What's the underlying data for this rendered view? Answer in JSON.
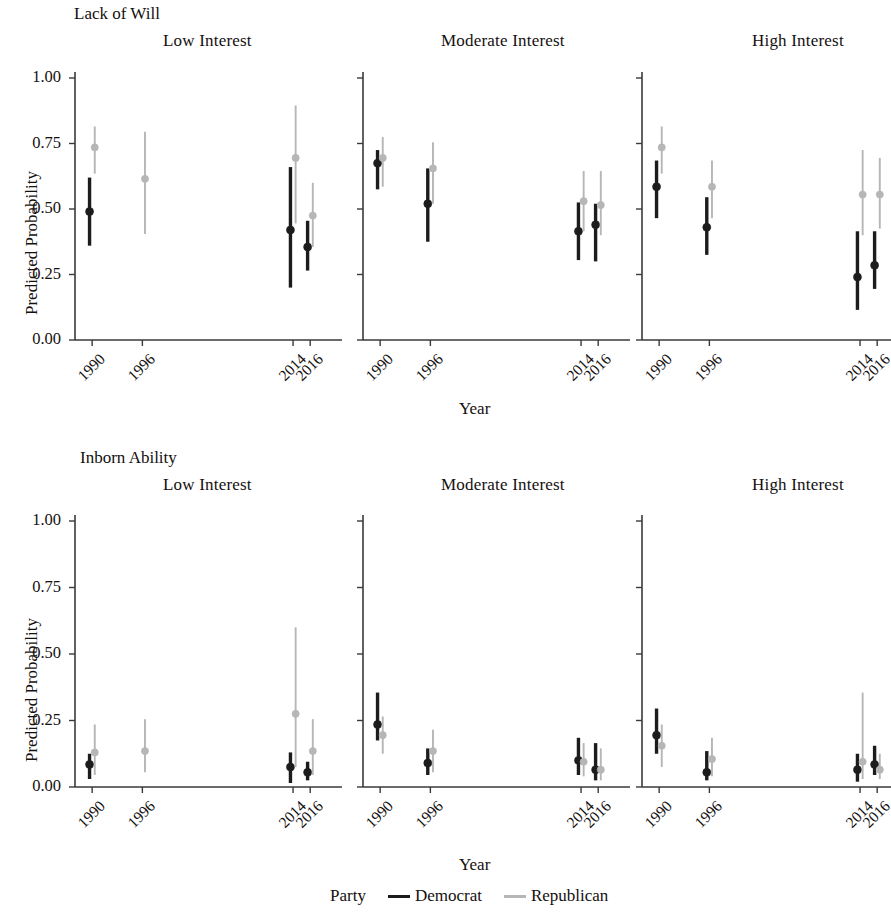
{
  "figure": {
    "y_axis_title": "Predicted Probability",
    "x_axis_title": "Year",
    "row_titles": [
      "Lack of Will",
      "Inborn Ability"
    ],
    "column_titles": [
      "Low Interest",
      "Moderate Interest",
      "High Interest"
    ],
    "y_ticks": [
      "0.00",
      "0.25",
      "0.50",
      "0.75",
      "1.00"
    ],
    "x_ticks": [
      "1990",
      "1996",
      "2014",
      "2016"
    ],
    "legend": {
      "title": "Party",
      "entries": [
        {
          "label": "Democrat",
          "color": "#1c1c1c"
        },
        {
          "label": "Republican",
          "color": "#b6b6b6"
        }
      ]
    }
  },
  "chart_data": {
    "type": "scatter",
    "xlabel": "Year",
    "ylabel": "Predicted Probability",
    "ylim": [
      0.0,
      1.0
    ],
    "yticks": [
      0.0,
      0.25,
      0.5,
      0.75,
      1.0
    ],
    "x": [
      1990,
      1996,
      2014,
      2016
    ],
    "grid": false,
    "legend_position": "bottom",
    "error_bars": "95% confidence intervals",
    "panels": [
      {
        "row": "Lack of Will",
        "column": "Low Interest",
        "series": [
          {
            "name": "Democrat",
            "color": "#1c1c1c",
            "points": [
              {
                "x": 1990,
                "y": 0.49,
                "lo": 0.36,
                "hi": 0.62
              },
              {
                "x": 1996,
                "y": null,
                "lo": null,
                "hi": null
              },
              {
                "x": 2014,
                "y": 0.42,
                "lo": 0.2,
                "hi": 0.66
              },
              {
                "x": 2016,
                "y": 0.355,
                "lo": 0.265,
                "hi": 0.455
              }
            ]
          },
          {
            "name": "Republican",
            "color": "#b6b6b6",
            "points": [
              {
                "x": 1990,
                "y": 0.735,
                "lo": 0.635,
                "hi": 0.815
              },
              {
                "x": 1996,
                "y": 0.615,
                "lo": 0.405,
                "hi": 0.795
              },
              {
                "x": 2014,
                "y": 0.695,
                "lo": 0.445,
                "hi": 0.895
              },
              {
                "x": 2016,
                "y": 0.475,
                "lo": 0.355,
                "hi": 0.6
              }
            ]
          }
        ]
      },
      {
        "row": "Lack of Will",
        "column": "Moderate Interest",
        "series": [
          {
            "name": "Democrat",
            "color": "#1c1c1c",
            "points": [
              {
                "x": 1990,
                "y": 0.675,
                "lo": 0.575,
                "hi": 0.725
              },
              {
                "x": 1996,
                "y": 0.52,
                "lo": 0.375,
                "hi": 0.655
              },
              {
                "x": 2014,
                "y": 0.415,
                "lo": 0.305,
                "hi": 0.525
              },
              {
                "x": 2016,
                "y": 0.44,
                "lo": 0.3,
                "hi": 0.52
              }
            ]
          },
          {
            "name": "Republican",
            "color": "#b6b6b6",
            "points": [
              {
                "x": 1990,
                "y": 0.695,
                "lo": 0.585,
                "hi": 0.775
              },
              {
                "x": 1996,
                "y": 0.655,
                "lo": 0.52,
                "hi": 0.755
              },
              {
                "x": 2014,
                "y": 0.53,
                "lo": 0.415,
                "hi": 0.645
              },
              {
                "x": 2016,
                "y": 0.515,
                "lo": 0.4,
                "hi": 0.645
              }
            ]
          }
        ]
      },
      {
        "row": "Lack of Will",
        "column": "High Interest",
        "series": [
          {
            "name": "Democrat",
            "color": "#1c1c1c",
            "points": [
              {
                "x": 1990,
                "y": 0.585,
                "lo": 0.465,
                "hi": 0.685
              },
              {
                "x": 1996,
                "y": 0.43,
                "lo": 0.325,
                "hi": 0.545
              },
              {
                "x": 2014,
                "y": 0.24,
                "lo": 0.115,
                "hi": 0.415
              },
              {
                "x": 2016,
                "y": 0.285,
                "lo": 0.195,
                "hi": 0.415
              }
            ]
          },
          {
            "name": "Republican",
            "color": "#b6b6b6",
            "points": [
              {
                "x": 1990,
                "y": 0.735,
                "lo": 0.635,
                "hi": 0.815
              },
              {
                "x": 1996,
                "y": 0.585,
                "lo": 0.465,
                "hi": 0.685
              },
              {
                "x": 2014,
                "y": 0.555,
                "lo": 0.4,
                "hi": 0.725
              },
              {
                "x": 2016,
                "y": 0.555,
                "lo": 0.425,
                "hi": 0.695
              }
            ]
          }
        ]
      },
      {
        "row": "Inborn Ability",
        "column": "Low Interest",
        "series": [
          {
            "name": "Democrat",
            "color": "#1c1c1c",
            "points": [
              {
                "x": 1990,
                "y": 0.085,
                "lo": 0.03,
                "hi": 0.125
              },
              {
                "x": 1996,
                "y": null,
                "lo": null,
                "hi": null
              },
              {
                "x": 2014,
                "y": 0.075,
                "lo": 0.015,
                "hi": 0.13
              },
              {
                "x": 2016,
                "y": 0.055,
                "lo": 0.025,
                "hi": 0.095
              }
            ]
          },
          {
            "name": "Republican",
            "color": "#b6b6b6",
            "points": [
              {
                "x": 1990,
                "y": 0.13,
                "lo": 0.045,
                "hi": 0.235
              },
              {
                "x": 1996,
                "y": 0.135,
                "lo": 0.055,
                "hi": 0.255
              },
              {
                "x": 2014,
                "y": 0.275,
                "lo": 0.075,
                "hi": 0.6
              },
              {
                "x": 2016,
                "y": 0.135,
                "lo": 0.045,
                "hi": 0.255
              }
            ]
          }
        ]
      },
      {
        "row": "Inborn Ability",
        "column": "Moderate Interest",
        "series": [
          {
            "name": "Democrat",
            "color": "#1c1c1c",
            "points": [
              {
                "x": 1990,
                "y": 0.235,
                "lo": 0.175,
                "hi": 0.355
              },
              {
                "x": 1996,
                "y": 0.09,
                "lo": 0.045,
                "hi": 0.145
              },
              {
                "x": 2014,
                "y": 0.1,
                "lo": 0.045,
                "hi": 0.185
              },
              {
                "x": 2016,
                "y": 0.065,
                "lo": 0.025,
                "hi": 0.165
              }
            ]
          },
          {
            "name": "Republican",
            "color": "#b6b6b6",
            "points": [
              {
                "x": 1990,
                "y": 0.195,
                "lo": 0.125,
                "hi": 0.265
              },
              {
                "x": 1996,
                "y": 0.135,
                "lo": 0.055,
                "hi": 0.215
              },
              {
                "x": 2014,
                "y": 0.095,
                "lo": 0.04,
                "hi": 0.165
              },
              {
                "x": 2016,
                "y": 0.065,
                "lo": 0.025,
                "hi": 0.145
              }
            ]
          }
        ]
      },
      {
        "row": "Inborn Ability",
        "column": "High Interest",
        "series": [
          {
            "name": "Democrat",
            "color": "#1c1c1c",
            "points": [
              {
                "x": 1990,
                "y": 0.195,
                "lo": 0.125,
                "hi": 0.295
              },
              {
                "x": 1996,
                "y": 0.055,
                "lo": 0.025,
                "hi": 0.135
              },
              {
                "x": 2014,
                "y": 0.065,
                "lo": 0.02,
                "hi": 0.125
              },
              {
                "x": 2016,
                "y": 0.085,
                "lo": 0.045,
                "hi": 0.155
              }
            ]
          },
          {
            "name": "Republican",
            "color": "#b6b6b6",
            "points": [
              {
                "x": 1990,
                "y": 0.155,
                "lo": 0.075,
                "hi": 0.235
              },
              {
                "x": 1996,
                "y": 0.105,
                "lo": 0.04,
                "hi": 0.185
              },
              {
                "x": 2014,
                "y": 0.095,
                "lo": 0.03,
                "hi": 0.355
              },
              {
                "x": 2016,
                "y": 0.065,
                "lo": 0.03,
                "hi": 0.125
              }
            ]
          }
        ]
      }
    ]
  },
  "layout": {
    "panel_x": [
      75,
      363,
      642
    ],
    "panel_width": 245,
    "row_top": [
      78,
      521
    ],
    "row_bottom": [
      340,
      787
    ],
    "x_frac": [
      0.07,
      0.275,
      0.89,
      0.96
    ]
  }
}
